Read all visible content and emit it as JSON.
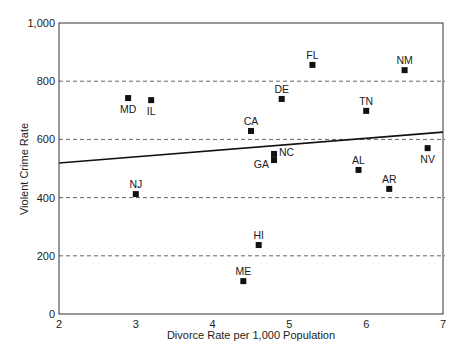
{
  "chart_data": {
    "type": "scatter",
    "title": "",
    "xlabel": "Divorce Rate per 1,000 Population",
    "ylabel": "Violent Crime Rate",
    "xlim": [
      2,
      7
    ],
    "ylim": [
      0,
      1000
    ],
    "x_ticks": [
      2,
      3,
      4,
      5,
      6,
      7
    ],
    "x_tick_labels": [
      "2",
      "3",
      "4",
      "5",
      "6",
      "7"
    ],
    "y_ticks": [
      0,
      200,
      400,
      600,
      800,
      1000
    ],
    "y_tick_labels": [
      "0",
      "200",
      "400",
      "600",
      "800",
      "1,000"
    ],
    "grid": {
      "horizontal_dashed": [
        200,
        400,
        600,
        800
      ],
      "vertical": false
    },
    "legend": null,
    "points": [
      {
        "label": "MD",
        "x": 2.9,
        "y": 742,
        "label_pos": "below"
      },
      {
        "label": "IL",
        "x": 3.2,
        "y": 735,
        "label_pos": "below"
      },
      {
        "label": "NJ",
        "x": 3.0,
        "y": 412,
        "label_pos": "above"
      },
      {
        "label": "CA",
        "x": 4.5,
        "y": 629,
        "label_pos": "above"
      },
      {
        "label": "DE",
        "x": 4.9,
        "y": 739,
        "label_pos": "above"
      },
      {
        "label": "FL",
        "x": 5.3,
        "y": 856,
        "label_pos": "above"
      },
      {
        "label": "NC",
        "x": 4.8,
        "y": 550,
        "label_pos": "right"
      },
      {
        "label": "GA",
        "x": 4.8,
        "y": 529,
        "label_pos": "left"
      },
      {
        "label": "HI",
        "x": 4.6,
        "y": 237,
        "label_pos": "above"
      },
      {
        "label": "ME",
        "x": 4.4,
        "y": 113,
        "label_pos": "above"
      },
      {
        "label": "TN",
        "x": 6.0,
        "y": 698,
        "label_pos": "above"
      },
      {
        "label": "NM",
        "x": 6.5,
        "y": 838,
        "label_pos": "above"
      },
      {
        "label": "AL",
        "x": 5.9,
        "y": 495,
        "label_pos": "above"
      },
      {
        "label": "AR",
        "x": 6.3,
        "y": 430,
        "label_pos": "above"
      },
      {
        "label": "NV",
        "x": 6.8,
        "y": 570,
        "label_pos": "below"
      }
    ],
    "trend_line": {
      "x": [
        2,
        7
      ],
      "y": [
        519,
        625
      ],
      "style": "solid"
    }
  }
}
